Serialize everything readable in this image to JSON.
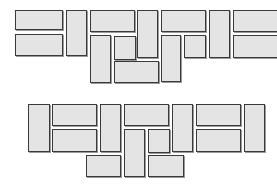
{
  "figure": {
    "title": "",
    "background_color": "#ffffff",
    "canvas_width": 277,
    "canvas_height": 186,
    "brick_fill_color": "#e4e4e4",
    "brick_border_color": "#3a3a3a",
    "brick_shadow_color": "#9a9a9a"
  },
  "chart_data": {
    "type": "diagram",
    "title": "",
    "subtitle": "",
    "xlabel": "",
    "ylabel": "",
    "legend": [],
    "annotations": [],
    "arrangements": [
      {
        "name": "top-arrangement",
        "label": "",
        "origin": [
          0,
          0
        ],
        "brick_count": 16,
        "bricks": [
          {
            "id": "t1",
            "x": 15,
            "y": 10,
            "w": 48,
            "h": 20,
            "orientation": "horizontal"
          },
          {
            "id": "t2",
            "x": 15,
            "y": 34,
            "w": 48,
            "h": 22,
            "orientation": "horizontal"
          },
          {
            "id": "t3",
            "x": 66,
            "y": 10,
            "w": 21,
            "h": 46,
            "orientation": "vertical"
          },
          {
            "id": "t4",
            "x": 90,
            "y": 10,
            "w": 45,
            "h": 22,
            "orientation": "horizontal"
          },
          {
            "id": "t5",
            "x": 90,
            "y": 35,
            "w": 21,
            "h": 48,
            "orientation": "vertical"
          },
          {
            "id": "t6",
            "x": 114,
            "y": 36,
            "w": 22,
            "h": 24,
            "orientation": "vertical"
          },
          {
            "id": "t7",
            "x": 114,
            "y": 61,
            "w": 45,
            "h": 22,
            "orientation": "horizontal"
          },
          {
            "id": "t8",
            "x": 137,
            "y": 10,
            "w": 21,
            "h": 48,
            "orientation": "vertical"
          },
          {
            "id": "t9",
            "x": 161,
            "y": 10,
            "w": 45,
            "h": 22,
            "orientation": "horizontal"
          },
          {
            "id": "t10",
            "x": 161,
            "y": 35,
            "w": 20,
            "h": 47,
            "orientation": "vertical"
          },
          {
            "id": "t11",
            "x": 184,
            "y": 35,
            "w": 22,
            "h": 23,
            "orientation": "vertical"
          },
          {
            "id": "t12",
            "x": 209,
            "y": 10,
            "w": 21,
            "h": 48,
            "orientation": "vertical"
          },
          {
            "id": "t13",
            "x": 233,
            "y": 10,
            "w": 45,
            "h": 22,
            "orientation": "horizontal"
          },
          {
            "id": "t14",
            "x": 233,
            "y": 35,
            "w": 45,
            "h": 23,
            "orientation": "horizontal"
          }
        ]
      },
      {
        "name": "bottom-arrangement",
        "label": "",
        "origin": [
          0,
          93
        ],
        "brick_count": 15,
        "bricks": [
          {
            "id": "b1",
            "x": 28,
            "y": 11,
            "w": 22,
            "h": 48,
            "orientation": "vertical"
          },
          {
            "id": "b2",
            "x": 52,
            "y": 11,
            "w": 45,
            "h": 22,
            "orientation": "horizontal"
          },
          {
            "id": "b3",
            "x": 52,
            "y": 36,
            "w": 45,
            "h": 23,
            "orientation": "horizontal"
          },
          {
            "id": "b4",
            "x": 100,
            "y": 11,
            "w": 21,
            "h": 48,
            "orientation": "vertical"
          },
          {
            "id": "b5",
            "x": 124,
            "y": 11,
            "w": 45,
            "h": 22,
            "orientation": "horizontal"
          },
          {
            "id": "b6",
            "x": 124,
            "y": 36,
            "w": 21,
            "h": 48,
            "orientation": "vertical"
          },
          {
            "id": "b7",
            "x": 86,
            "y": 62,
            "w": 35,
            "h": 22,
            "orientation": "horizontal"
          },
          {
            "id": "b8",
            "x": 148,
            "y": 36,
            "w": 22,
            "h": 24,
            "orientation": "vertical"
          },
          {
            "id": "b9",
            "x": 148,
            "y": 62,
            "w": 36,
            "h": 22,
            "orientation": "horizontal"
          },
          {
            "id": "b10",
            "x": 172,
            "y": 11,
            "w": 21,
            "h": 48,
            "orientation": "vertical"
          },
          {
            "id": "b11",
            "x": 196,
            "y": 11,
            "w": 45,
            "h": 22,
            "orientation": "horizontal"
          },
          {
            "id": "b12",
            "x": 196,
            "y": 36,
            "w": 45,
            "h": 23,
            "orientation": "horizontal"
          },
          {
            "id": "b13",
            "x": 244,
            "y": 11,
            "w": 21,
            "h": 48,
            "orientation": "vertical"
          }
        ]
      }
    ]
  }
}
